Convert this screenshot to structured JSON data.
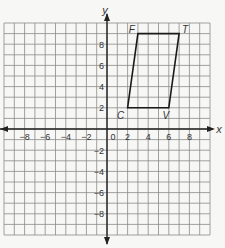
{
  "chart_data": {
    "type": "coordinate-plane",
    "title": "",
    "xlabel": "x",
    "ylabel": "y",
    "xlim": [
      -10,
      10
    ],
    "ylim": [
      -10,
      10
    ],
    "grid": true,
    "grid_step": 1,
    "x_ticks": [
      -8,
      -6,
      -4,
      -2,
      2,
      4,
      6,
      8
    ],
    "y_ticks": [
      -8,
      -6,
      -4,
      -2,
      2,
      4,
      6,
      8
    ],
    "origin_label": "0",
    "polygon": {
      "name": "CFTV",
      "vertices": [
        {
          "label": "C",
          "x": 2,
          "y": 2
        },
        {
          "label": "F",
          "x": 3,
          "y": 9
        },
        {
          "label": "T",
          "x": 7,
          "y": 9
        },
        {
          "label": "V",
          "x": 6,
          "y": 2
        }
      ]
    }
  },
  "colors": {
    "grid": "#8a8a8a",
    "axis": "#222222",
    "shape": "#1a1a1a",
    "background": "#f7f7f5"
  }
}
